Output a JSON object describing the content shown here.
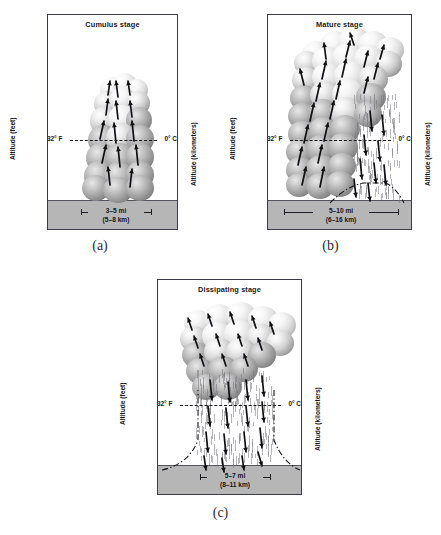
{
  "figure": {
    "axis_left_label": "Altitude (feet)",
    "axis_right_label": "Altitude (kilometers)",
    "feet_ticks": [
      "40,000",
      "30,000",
      "20,000",
      "10,000",
      "5,000"
    ],
    "feet_tick_values": [
      40000,
      30000,
      20000,
      10000,
      5000
    ],
    "km_ticks": [
      "12",
      "11",
      "10",
      "9",
      "8",
      "7",
      "6",
      "5",
      "4",
      "3",
      "2",
      "1"
    ],
    "km_tick_values": [
      12,
      11,
      10,
      9,
      8,
      7,
      6,
      5,
      4,
      3,
      2,
      1
    ],
    "freezing_label_left": "32° F",
    "freezing_label_right": "0° C",
    "freezing_altitude_ft": 15000,
    "axis_max_ft": 44000,
    "axis_min_ft": 0,
    "colors": {
      "ground": "#b6b6b6",
      "border": "#3b3b4a",
      "text": "#14141a",
      "cloud_light": "#f2f2f2",
      "cloud_dark": "#6a6a6a",
      "rain": "#787880"
    }
  },
  "panels": [
    {
      "id": "a",
      "caption": "(a)",
      "title": "Cumulus stage",
      "width_mi": "3–5 mi",
      "width_km": "(5–8 km)",
      "has_rain": false,
      "has_gust_front": false
    },
    {
      "id": "b",
      "caption": "(b)",
      "title": "Mature stage",
      "width_mi": "5–10 mi",
      "width_km": "(6–16 km)",
      "has_rain": true,
      "has_gust_front": true
    },
    {
      "id": "c",
      "caption": "(c)",
      "title": "Dissipating stage",
      "width_mi": "5–7 mi",
      "width_km": "(8–11 km)",
      "has_rain": true,
      "has_gust_front": true
    }
  ],
  "chart_data": {
    "type": "diagram",
    "xlabel": "",
    "ylabel": "Altitude (feet)",
    "y2label": "Altitude (kilometers)",
    "ylim": [
      0,
      44000
    ],
    "y2lim": [
      0,
      13.4
    ],
    "grid": false,
    "legend": "none",
    "annotations": [
      "32° F",
      "0° C"
    ],
    "series": [
      {
        "name": "Cumulus stage",
        "panel": "a",
        "storm_width_mi": [
          3,
          5
        ],
        "storm_width_km": [
          5,
          8
        ],
        "cloud_top_ft": 19000,
        "cloud_base_ft": 3500,
        "updrafts": true,
        "downdrafts": false,
        "precipitation": false
      },
      {
        "name": "Mature stage",
        "panel": "b",
        "storm_width_mi": [
          5,
          10
        ],
        "storm_width_km": [
          6,
          16
        ],
        "cloud_top_ft": 41000,
        "cloud_base_ft": 3500,
        "updrafts": true,
        "downdrafts": true,
        "precipitation": true
      },
      {
        "name": "Dissipating stage",
        "panel": "c",
        "storm_width_mi": [
          5,
          7
        ],
        "storm_width_km": [
          8,
          11
        ],
        "cloud_top_ft": 37000,
        "cloud_base_ft": 19000,
        "updrafts": false,
        "downdrafts": true,
        "precipitation": true
      }
    ]
  }
}
